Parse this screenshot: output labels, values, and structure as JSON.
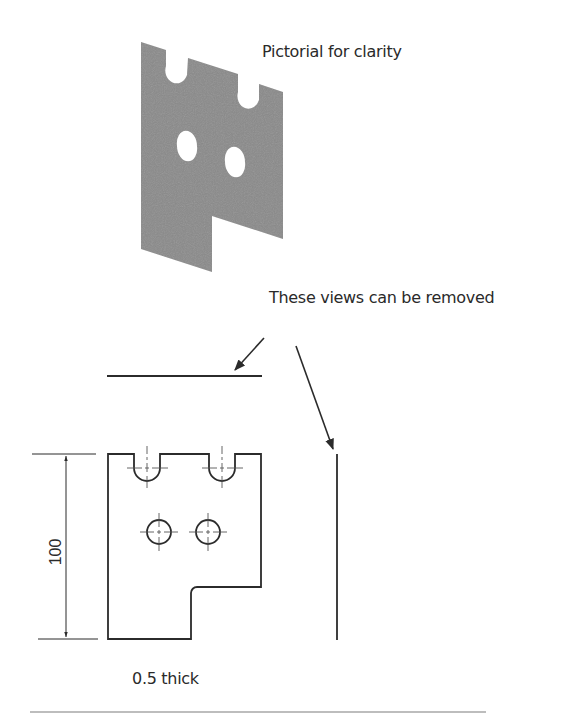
{
  "captions": {
    "pictorial": "Pictorial for clarity",
    "removable_views": "These views can be removed",
    "thickness": "0.5 thick"
  },
  "dimensions": {
    "height": "100"
  },
  "colors": {
    "plate_fill": "#8a8a8a",
    "line": "#2b2b2b",
    "centerline": "#555555",
    "rule": "#bdbdbd"
  },
  "views": {
    "pictorial": {
      "notches": 2,
      "holes": 2
    },
    "front": {
      "notches": 2,
      "holes": 2,
      "step": true
    },
    "top": {
      "type": "edge-line"
    },
    "side": {
      "type": "edge-line"
    }
  }
}
